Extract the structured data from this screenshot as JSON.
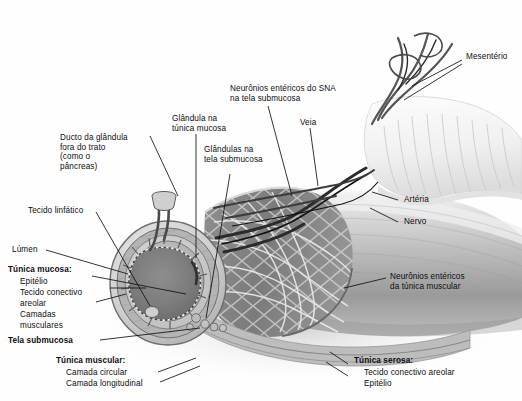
{
  "figure": {
    "style": "grayscale anatomical illustration",
    "background_color": "#ffffff",
    "line_color": "#111111"
  },
  "labels": {
    "mesenterio": "Mesentério",
    "neuronios_submucosa": "Neurônios entéricos do SNA\nna tela submucosa",
    "veia": "Veia",
    "arteria": "Artéria",
    "nervo": "Nervo",
    "glandula_mucosa": "Glândula na\ntúnica mucosa",
    "glandulas_submucosa": "Glândulas na\ntela submucosa",
    "ducto_glandula": "Ducto da glândula\nfora do trato\n(como o\npâncreas)",
    "tecido_linfatico": "Tecido linfático",
    "lumen": "Lúmen",
    "tunica_mucosa": "Túnica mucosa:",
    "epitelio_mucosa": "Epitélio",
    "tecido_conectivo_areolar": "Tecido conectivo",
    "areolar": "areolar",
    "camadas": "Camadas",
    "musculares": "musculares",
    "tela_submucosa": "Tela submucosa",
    "tunica_muscular": "Túnica muscular:",
    "camada_circular": "Camada circular",
    "camada_longitudinal": "Camada longitudinal",
    "neuronios_muscular": "Neurônios entéricos\nda túnica muscular",
    "tunica_serosa": "Túnica serosa:",
    "serosa_tecido": "Tecido conectivo areolar",
    "serosa_epitelio": "Epitélio"
  },
  "layers": [
    "Túnica mucosa",
    "Tela submucosa",
    "Túnica muscular",
    "Túnica serosa"
  ],
  "structures": [
    "Mesentério",
    "Veia",
    "Artéria",
    "Nervo",
    "Lúmen",
    "Tecido linfático",
    "Glândula na túnica mucosa",
    "Glândulas na tela submucosa",
    "Ducto da glândula fora do trato",
    "Neurônios entéricos do SNA na tela submucosa",
    "Neurônios entéricos da túnica muscular"
  ]
}
